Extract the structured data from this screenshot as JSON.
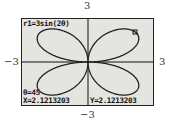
{
  "window": {
    "labels": {
      "ymax": "3",
      "ymin": "−3",
      "xmin": "−3",
      "xmax": "3"
    }
  },
  "screen": {
    "equation": "r1=3sin(2θ)",
    "theta": "θ=45",
    "x_readout": "X=2.1213203",
    "y_readout": "Y=2.1213203",
    "colors": {
      "background": "#e4e4e0",
      "curve": "#222222"
    }
  },
  "chart_data": {
    "type": "line",
    "title": "r1=3sin(2θ)",
    "xlabel": "",
    "ylabel": "",
    "xlim": [
      -3,
      3
    ],
    "ylim": [
      -3,
      3
    ],
    "grid": false,
    "trace_point": {
      "theta": 45,
      "x": 2.1213203,
      "y": 2.1213203
    }
  }
}
